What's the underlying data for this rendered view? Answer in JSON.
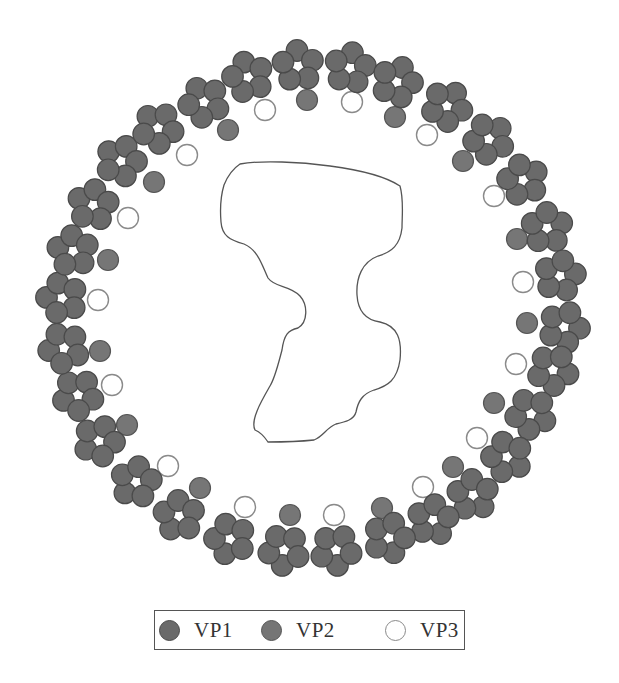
{
  "figure": {
    "type": "virus capsid cross-section schematic",
    "ring_center": [
      313,
      308
    ],
    "colors": {
      "vp1_fill": "#6a6a6a",
      "vp1_stroke": "#4a4a4a",
      "vp2_fill": "#767676",
      "vp2_stroke": "#555555",
      "vp3_fill": "#ffffff",
      "vp3_stroke": "#8a8a8a",
      "genome_outline": "#555555"
    },
    "vp1_pentamers": [
      [
        298,
        66
      ],
      [
        350,
        68
      ],
      [
        397,
        82
      ],
      [
        447,
        106
      ],
      [
        489,
        139
      ],
      [
        523,
        180
      ],
      [
        547,
        228
      ],
      [
        560,
        276
      ],
      [
        564,
        327
      ],
      [
        553,
        370
      ],
      [
        531,
        414
      ],
      [
        507,
        457
      ],
      [
        473,
        495
      ],
      [
        433,
        520
      ],
      [
        389,
        538
      ],
      [
        336,
        550
      ],
      [
        284,
        550
      ],
      [
        230,
        539
      ],
      [
        179,
        516
      ],
      [
        136,
        482
      ],
      [
        99,
        441
      ],
      [
        78,
        395
      ],
      [
        64,
        348
      ],
      [
        62,
        298
      ],
      [
        73,
        251
      ],
      [
        93,
        205
      ],
      [
        121,
        161
      ],
      [
        158,
        128
      ],
      [
        204,
        102
      ],
      [
        248,
        77
      ]
    ],
    "vp2_subunits": [
      [
        228,
        130
      ],
      [
        307,
        100
      ],
      [
        395,
        117
      ],
      [
        463,
        161
      ],
      [
        517,
        239
      ],
      [
        527,
        323
      ],
      [
        494,
        403
      ],
      [
        453,
        467
      ],
      [
        382,
        508
      ],
      [
        290,
        515
      ],
      [
        200,
        488
      ],
      [
        127,
        425
      ],
      [
        100,
        351
      ],
      [
        108,
        260
      ],
      [
        154,
        182
      ]
    ],
    "vp3_subunits": [
      [
        265,
        110
      ],
      [
        352,
        102
      ],
      [
        427,
        135
      ],
      [
        494,
        196
      ],
      [
        523,
        282
      ],
      [
        516,
        364
      ],
      [
        477,
        438
      ],
      [
        423,
        487
      ],
      [
        334,
        515
      ],
      [
        245,
        507
      ],
      [
        168,
        466
      ],
      [
        112,
        385
      ],
      [
        98,
        300
      ],
      [
        128,
        218
      ],
      [
        187,
        155
      ]
    ],
    "genome_path": "M 240 164 C 262 160, 300 162, 330 166 C 360 170, 385 176, 400 186 C 404 200, 402 215, 402 228 C 400 245, 392 252, 378 256 C 362 262, 356 278, 357 295 C 358 312, 366 320, 380 322 C 398 326, 402 340, 400 360 C 397 380, 388 386, 374 390 C 362 394, 358 402, 356 412 C 354 420, 345 422, 336 424 C 326 428, 324 436, 314 440 C 295 442, 280 442, 268 442 C 264 436, 260 432, 255 430 C 250 420, 262 400, 270 386 C 275 378, 278 365, 282 350 C 284 335, 288 330, 298 328 C 308 322, 308 305, 300 296 C 290 285, 275 288, 268 278 C 262 265, 258 250, 244 244 C 230 240, 222 236, 221 222 C 220 210, 221 195, 224 185 C 228 175, 234 168, 240 164 Z"
  },
  "legend": {
    "items": [
      {
        "label": "VP1",
        "swatch": "vp1"
      },
      {
        "label": "VP2",
        "swatch": "vp2"
      },
      {
        "label": "VP3",
        "swatch": "vp3"
      }
    ]
  }
}
